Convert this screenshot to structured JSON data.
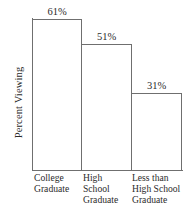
{
  "chart_data": {
    "type": "bar",
    "title": "",
    "subtitle": "",
    "xlabel": "",
    "ylabel": "Percent Viewing",
    "categories": [
      "College Graduate",
      "High School Graduate",
      "Less than High School Graduate"
    ],
    "category_lines": [
      [
        "College",
        "Graduate"
      ],
      [
        "High",
        "School",
        "Graduate"
      ],
      [
        "Less than",
        "High School",
        "Graduate"
      ]
    ],
    "values": [
      61,
      51,
      31
    ],
    "value_labels": [
      "61%",
      "51%",
      "31%"
    ],
    "units": "percent",
    "ylim": [
      0,
      63.5
    ],
    "grid": false,
    "legend": null,
    "bar_fill": "#ffffff",
    "bar_outline": "#6f6f6f",
    "axis_color": "#6f6f6f",
    "text_color": "#2b2b2b",
    "background": "#ffffff"
  }
}
